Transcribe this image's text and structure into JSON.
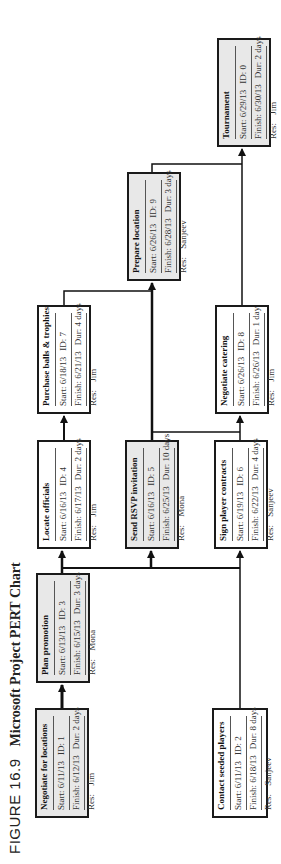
{
  "figure": {
    "number": "FIGURE 16.9",
    "title": "Microsoft Project PERT Chart"
  },
  "labels": {
    "start": "Start:",
    "finish": "Finish:",
    "id": "ID:",
    "dur": "Dur:",
    "res": "Res:"
  },
  "tasks": [
    {
      "id": "1",
      "name": "Negotiate for locations",
      "start": "6/11/13",
      "finish": "6/12/13",
      "duration": "2 days",
      "resource": "Jim",
      "critical": true
    },
    {
      "id": "2",
      "name": "Contact seeded players",
      "start": "6/11/13",
      "finish": "6/18/13",
      "duration": "8 days",
      "resource": "Sanjeev",
      "critical": false
    },
    {
      "id": "3",
      "name": "Plan promotion",
      "start": "6/13/13",
      "finish": "6/15/13",
      "duration": "3 days",
      "resource": "Mona",
      "critical": true
    },
    {
      "id": "4",
      "name": "Locate officials",
      "start": "6/16/13",
      "finish": "6/17/13",
      "duration": "2 days",
      "resource": "Jim",
      "critical": false
    },
    {
      "id": "5",
      "name": "Send RSVP invitation",
      "start": "6/16/13",
      "finish": "6/25/13",
      "duration": "10 days",
      "resource": "Mona",
      "critical": true
    },
    {
      "id": "6",
      "name": "Sign player contracts",
      "start": "6/19/13",
      "finish": "6/22/13",
      "duration": "4 days",
      "resource": "Sanjeev",
      "critical": false
    },
    {
      "id": "7",
      "name": "Purchase balls & trophies",
      "start": "6/18/13",
      "finish": "6/21/13",
      "duration": "4 days",
      "resource": "Jim",
      "critical": false
    },
    {
      "id": "8",
      "name": "Negotiate catering",
      "start": "6/26/13",
      "finish": "6/26/13",
      "duration": "1 day",
      "resource": "Jim",
      "critical": false
    },
    {
      "id": "9",
      "name": "Prepare location",
      "start": "6/26/13",
      "finish": "6/28/13",
      "duration": "3 days",
      "resource": "Sanjeev",
      "critical": true
    },
    {
      "id": "0",
      "name": "Tournament",
      "start": "6/29/13",
      "finish": "6/30/13",
      "duration": "2 days",
      "resource": "Jim",
      "critical": true
    }
  ],
  "dependencies": [
    {
      "from": "1",
      "to": "3"
    },
    {
      "from": "3",
      "to": "4"
    },
    {
      "from": "3",
      "to": "5"
    },
    {
      "from": "3",
      "to": "6"
    },
    {
      "from": "2",
      "to": "6"
    },
    {
      "from": "4",
      "to": "7"
    },
    {
      "from": "5",
      "to": "9"
    },
    {
      "from": "7",
      "to": "9"
    },
    {
      "from": "5",
      "to": "8"
    },
    {
      "from": "6",
      "to": "8"
    },
    {
      "from": "9",
      "to": "0"
    },
    {
      "from": "8",
      "to": "0"
    }
  ],
  "colors": {
    "critical_fill": "#e8e8e8",
    "normal_fill": "#ffffff",
    "border": "#1a1a1a",
    "line": "#111111"
  }
}
